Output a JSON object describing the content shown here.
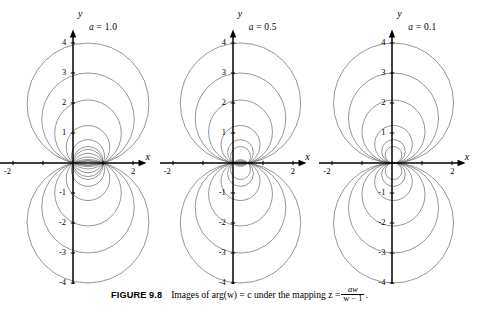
{
  "figure": {
    "number_label": "FIGURE 9.8",
    "caption_text": "Images of arg(w) = c under the mapping z =",
    "caption_fraction_numerator": "aw",
    "caption_fraction_denominator": "w − 1",
    "caption_period": "."
  },
  "axes": {
    "x_label": "x",
    "y_label": "y",
    "x_ticks": [
      -2,
      -1,
      1,
      2
    ],
    "x_tick_labels_shown": [
      "-2",
      "2"
    ],
    "y_ticks": [
      -4,
      -3,
      -2,
      -1,
      1,
      2,
      3,
      4
    ],
    "y_tick_labels_shown": [
      "4",
      "3",
      "2",
      "1",
      "-1",
      "-2",
      "-3",
      "-4"
    ],
    "x_range": [
      -2.45,
      2.45
    ],
    "y_range": [
      -4.45,
      4.45
    ],
    "line_color": "#000000",
    "curve_color": "#555555"
  },
  "panels": [
    {
      "name": "panel-a-1.0",
      "param_name": "a",
      "param_equals": "=",
      "param_value": "1.0",
      "param_label_full": "a = 1.0",
      "a": 1.0,
      "upper_circle_tops": [
        4.0,
        3.0,
        2.1,
        1.25,
        0.78,
        0.55
      ],
      "has_mirror_below": true
    },
    {
      "name": "panel-a-0.5",
      "param_name": "a",
      "param_equals": "=",
      "param_value": "0.5",
      "param_label_full": "a = 0.5",
      "a": 0.5,
      "upper_circle_tops": [
        4.0,
        3.0,
        2.1,
        1.25,
        0.78,
        0.55
      ],
      "has_mirror_below": true
    },
    {
      "name": "panel-a-0.1",
      "param_name": "a",
      "param_equals": "=",
      "param_value": "0.1",
      "param_label_full": "a = 0.1",
      "a": 0.1,
      "upper_circle_tops": [
        4.0,
        3.0,
        2.1,
        1.25,
        0.78,
        0.55
      ],
      "has_mirror_below": true
    }
  ],
  "chart_data": {
    "type": "line",
    "xlabel": "x",
    "ylabel": "y",
    "xlim": [
      -2.45,
      2.45
    ],
    "ylim": [
      -4.45,
      4.45
    ],
    "grid": false,
    "legend": "none",
    "panels": [
      {
        "param": "a = 1.0",
        "a": 1.0,
        "common_points": [
          [
            0,
            0
          ],
          [
            1.0,
            0
          ]
        ],
        "series": [
          {
            "name": "upper-1",
            "top_y": 4.0
          },
          {
            "name": "upper-2",
            "top_y": 3.0
          },
          {
            "name": "upper-3",
            "top_y": 2.1
          },
          {
            "name": "upper-4",
            "top_y": 1.25
          },
          {
            "name": "upper-5",
            "top_y": 0.78
          },
          {
            "name": "upper-6",
            "top_y": 0.55
          },
          {
            "name": "lower-1",
            "top_y": -4.0
          },
          {
            "name": "lower-2",
            "top_y": -3.0
          },
          {
            "name": "lower-3",
            "top_y": -2.1
          },
          {
            "name": "lower-4",
            "top_y": -1.25
          },
          {
            "name": "lower-5",
            "top_y": -0.78
          },
          {
            "name": "lower-6",
            "top_y": -0.55
          }
        ]
      },
      {
        "param": "a = 0.5",
        "a": 0.5,
        "common_points": [
          [
            0,
            0
          ],
          [
            0.5,
            0
          ]
        ],
        "series": [
          {
            "name": "upper-1",
            "top_y": 4.0
          },
          {
            "name": "upper-2",
            "top_y": 3.0
          },
          {
            "name": "upper-3",
            "top_y": 2.1
          },
          {
            "name": "upper-4",
            "top_y": 1.25
          },
          {
            "name": "upper-5",
            "top_y": 0.78
          },
          {
            "name": "upper-6",
            "top_y": 0.55
          },
          {
            "name": "lower-1",
            "top_y": -4.0
          },
          {
            "name": "lower-2",
            "top_y": -3.0
          },
          {
            "name": "lower-3",
            "top_y": -2.1
          },
          {
            "name": "lower-4",
            "top_y": -1.25
          },
          {
            "name": "lower-5",
            "top_y": -0.78
          },
          {
            "name": "lower-6",
            "top_y": -0.55
          }
        ]
      },
      {
        "param": "a = 0.1",
        "a": 0.1,
        "common_points": [
          [
            0,
            0
          ],
          [
            0.1,
            0
          ]
        ],
        "series": [
          {
            "name": "upper-1",
            "top_y": 4.0
          },
          {
            "name": "upper-2",
            "top_y": 3.0
          },
          {
            "name": "upper-3",
            "top_y": 2.1
          },
          {
            "name": "upper-4",
            "top_y": 1.25
          },
          {
            "name": "upper-5",
            "top_y": 0.78
          },
          {
            "name": "upper-6",
            "top_y": 0.55
          },
          {
            "name": "lower-1",
            "top_y": -4.0
          },
          {
            "name": "lower-2",
            "top_y": -3.0
          },
          {
            "name": "lower-3",
            "top_y": -2.1
          },
          {
            "name": "lower-4",
            "top_y": -1.25
          },
          {
            "name": "lower-5",
            "top_y": -0.78
          },
          {
            "name": "lower-6",
            "top_y": -0.55
          }
        ]
      }
    ]
  }
}
